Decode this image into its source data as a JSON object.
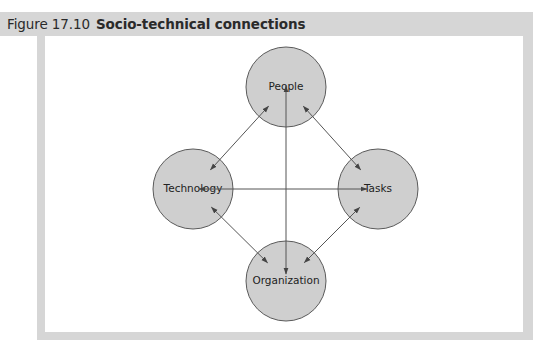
{
  "figure": {
    "number": "Figure 17.10",
    "title": "Socio-technical connections"
  },
  "diagram": {
    "type": "network",
    "nodes": [
      {
        "id": "people",
        "label": "People"
      },
      {
        "id": "technology",
        "label": "Technology"
      },
      {
        "id": "tasks",
        "label": "Tasks"
      },
      {
        "id": "organization",
        "label": "Organization"
      }
    ],
    "edges": [
      {
        "from": "people",
        "to": "technology",
        "direction": "both"
      },
      {
        "from": "people",
        "to": "tasks",
        "direction": "both"
      },
      {
        "from": "people",
        "to": "organization",
        "direction": "both"
      },
      {
        "from": "technology",
        "to": "tasks",
        "direction": "both"
      },
      {
        "from": "technology",
        "to": "organization",
        "direction": "both"
      },
      {
        "from": "tasks",
        "to": "organization",
        "direction": "both"
      }
    ],
    "colors": {
      "node_fill": "#cfcfcf",
      "node_stroke": "#5a5a5a",
      "edge": "#555555",
      "frame": "#d6d6d6"
    }
  }
}
